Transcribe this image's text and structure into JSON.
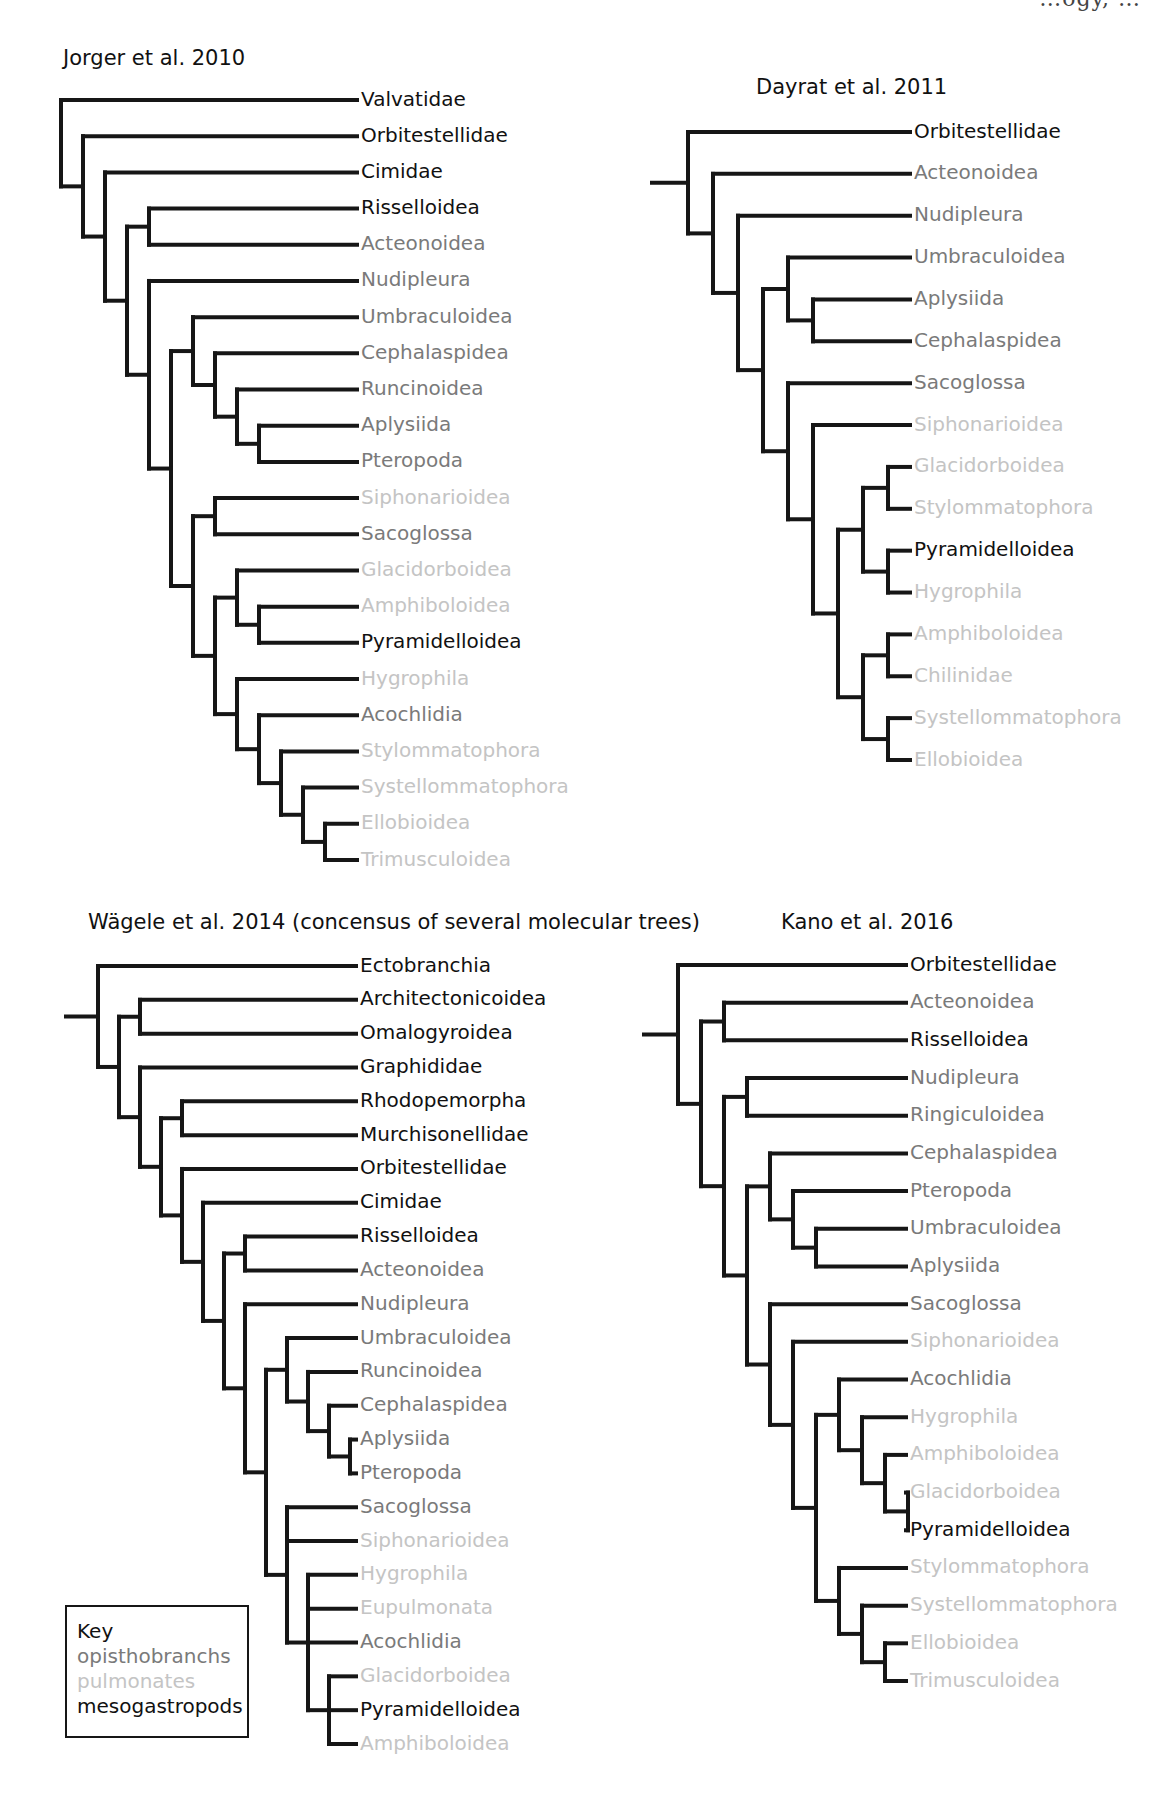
{
  "header_fragment": "…ogy, …",
  "colors": {
    "mesogastropods": "#111111",
    "opisthobranchs": "#7a7a7a",
    "pulmonates": "#c4c4c4",
    "branch": "#161616"
  },
  "key": {
    "title": "Key",
    "entries": [
      {
        "label": "opisthobranchs",
        "group": "opisthobranchs"
      },
      {
        "label": "pulmonates",
        "group": "pulmonates"
      },
      {
        "label": "mesogastropods",
        "group": "mesogastropods"
      }
    ]
  },
  "trees": [
    {
      "id": "jorger",
      "title": "Jorger et al. 2010",
      "rooted_stem": false,
      "tree": [
        "Valvatidae",
        [
          "Orbitestellidae",
          [
            "Cimidae",
            [
              [
                "Risselloidea",
                "Acteonoidea"
              ],
              [
                "Nudipleura",
                [
                  [
                    "Umbraculoidea",
                    [
                      "Cephalaspidea",
                      [
                        "Runcinoidea",
                        [
                          "Aplysiida",
                          "Pteropoda"
                        ]
                      ]
                    ]
                  ],
                  [
                    [
                      "Siphonarioidea",
                      "Sacoglossa"
                    ],
                    [
                      [
                        "Glacidorboidea",
                        [
                          "Amphiboloidea",
                          "Pyramidelloidea"
                        ]
                      ],
                      [
                        "Hygrophila",
                        [
                          "Acochlidia",
                          [
                            "Stylommatophora",
                            [
                              "Systellommatophora",
                              [
                                "Ellobioidea",
                                "Trimusculoidea"
                              ]
                            ]
                          ]
                        ]
                      ]
                    ]
                  ]
                ]
              ]
            ]
          ]
        ]
      ]
    },
    {
      "id": "dayrat",
      "title": "Dayrat et al. 2011",
      "rooted_stem": true,
      "tree": [
        "Orbitestellidae",
        [
          "Acteonoidea",
          [
            "Nudipleura",
            [
              [
                "Umbraculoidea",
                [
                  "Aplysiida",
                  "Cephalaspidea"
                ]
              ],
              [
                "Sacoglossa",
                [
                  "Siphonarioidea",
                  [
                    [
                      [
                        "Glacidorboidea",
                        "Stylommatophora"
                      ],
                      [
                        "Pyramidelloidea",
                        "Hygrophila"
                      ]
                    ],
                    [
                      [
                        "Amphiboloidea",
                        "Chilinidae"
                      ],
                      [
                        "Systellommatophora",
                        "Ellobioidea"
                      ]
                    ]
                  ]
                ]
              ]
            ]
          ]
        ]
      ]
    },
    {
      "id": "wagele",
      "title": "Wägele et al. 2014 (concensus of several molecular trees)",
      "rooted_stem": true,
      "tree": [
        "Ectobranchia",
        [
          [
            "Architectonicoidea",
            "Omalogyroidea"
          ],
          [
            "Graphididae",
            [
              [
                "Rhodopemorpha",
                "Murchisonellidae"
              ],
              [
                "Orbitestellidae",
                [
                  "Cimidae",
                  [
                    [
                      "Risselloidea",
                      "Acteonoidea"
                    ],
                    [
                      "Nudipleura",
                      [
                        [
                          "Umbraculoidea",
                          [
                            "Runcinoidea",
                            [
                              "Cephalaspidea",
                              [
                                "Aplysiida",
                                "Pteropoda"
                              ]
                            ]
                          ]
                        ],
                        [
                          "Sacoglossa",
                          "Siphonarioidea",
                          [
                            "Hygrophila",
                            "Eupulmonata",
                            "Acochlidia",
                            [
                              "Glacidorboidea",
                              "Pyramidelloidea",
                              "Amphiboloidea"
                            ]
                          ]
                        ]
                      ]
                    ]
                  ]
                ]
              ]
            ]
          ]
        ]
      ]
    },
    {
      "id": "kano",
      "title": "Kano et al. 2016",
      "rooted_stem": true,
      "tree": [
        "Orbitestellidae",
        [
          [
            "Acteonoidea",
            "Risselloidea"
          ],
          [
            [
              "Nudipleura",
              "Ringiculoidea"
            ],
            [
              [
                "Cephalaspidea",
                [
                  "Pteropoda",
                  [
                    "Umbraculoidea",
                    "Aplysiida"
                  ]
                ]
              ],
              [
                "Sacoglossa",
                [
                  "Siphonarioidea",
                  [
                    [
                      "Acochlidia",
                      [
                        "Hygrophila",
                        [
                          "Amphiboloidea",
                          [
                            "Glacidorboidea",
                            "Pyramidelloidea"
                          ]
                        ]
                      ]
                    ],
                    [
                      "Stylommatophora",
                      [
                        "Systellommatophora",
                        [
                          "Ellobioidea",
                          "Trimusculoidea"
                        ]
                      ]
                    ]
                  ]
                ]
              ]
            ]
          ]
        ]
      ]
    }
  ],
  "taxon_groups": {
    "Valvatidae": "mesogastropods",
    "Orbitestellidae": "mesogastropods",
    "Cimidae": "mesogastropods",
    "Risselloidea": "mesogastropods",
    "Pyramidelloidea": "mesogastropods",
    "Ectobranchia": "mesogastropods",
    "Architectonicoidea": "mesogastropods",
    "Omalogyroidea": "mesogastropods",
    "Graphididae": "mesogastropods",
    "Rhodopemorpha": "mesogastropods",
    "Murchisonellidae": "mesogastropods",
    "Acteonoidea": "opisthobranchs",
    "Nudipleura": "opisthobranchs",
    "Umbraculoidea": "opisthobranchs",
    "Cephalaspidea": "opisthobranchs",
    "Runcinoidea": "opisthobranchs",
    "Aplysiida": "opisthobranchs",
    "Pteropoda": "opisthobranchs",
    "Sacoglossa": "opisthobranchs",
    "Acochlidia": "opisthobranchs",
    "Ringiculoidea": "opisthobranchs",
    "Siphonarioidea": "pulmonates",
    "Glacidorboidea": "pulmonates",
    "Amphiboloidea": "pulmonates",
    "Hygrophila": "pulmonates",
    "Stylommatophora": "pulmonates",
    "Systellommatophora": "pulmonates",
    "Ellobioidea": "pulmonates",
    "Trimusculoidea": "pulmonates",
    "Chilinidae": "pulmonates",
    "Eupulmonata": "pulmonates"
  }
}
